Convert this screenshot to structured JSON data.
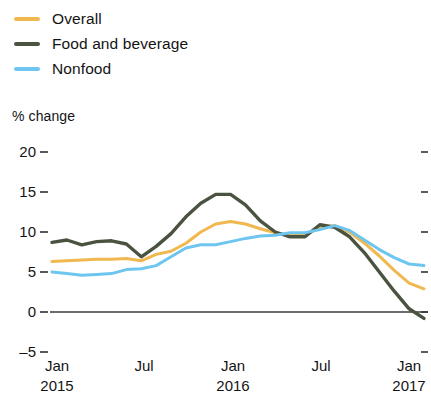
{
  "chart_data": {
    "type": "line",
    "title": "",
    "xlabel": "",
    "ylabel": "% change",
    "ylim": [
      -5,
      20
    ],
    "yticks": [
      20,
      15,
      10,
      5,
      0,
      -5
    ],
    "ytick_labels": [
      "20",
      "15",
      "10",
      "5",
      "0",
      "–5"
    ],
    "grid": false,
    "legend_position": "top-left",
    "zero_line": true,
    "x_tick_labels": [
      {
        "month": "Jan",
        "year": "2015"
      },
      {
        "month": "Jul",
        "year": ""
      },
      {
        "month": "Jan",
        "year": "2016"
      },
      {
        "month": "Jul",
        "year": ""
      },
      {
        "month": "Jan",
        "year": "2017"
      }
    ],
    "x": [
      "2015-01",
      "2015-02",
      "2015-03",
      "2015-04",
      "2015-05",
      "2015-06",
      "2015-07",
      "2015-08",
      "2015-09",
      "2015-10",
      "2015-11",
      "2015-12",
      "2016-01",
      "2016-02",
      "2016-03",
      "2016-04",
      "2016-05",
      "2016-06",
      "2016-07",
      "2016-08",
      "2016-09",
      "2016-10",
      "2016-11",
      "2016-12",
      "2017-01",
      "2017-02"
    ],
    "series": [
      {
        "name": "Overall",
        "color": "#F0B84E",
        "values": [
          6.3,
          6.4,
          6.5,
          6.6,
          6.6,
          6.7,
          6.4,
          7.2,
          7.6,
          8.6,
          10.0,
          11.0,
          11.3,
          11.0,
          10.4,
          9.9,
          9.6,
          9.6,
          10.6,
          10.8,
          10.0,
          8.6,
          7.0,
          5.2,
          3.6,
          2.9
        ]
      },
      {
        "name": "Food and beverage",
        "color": "#4A5240",
        "values": [
          8.7,
          9.0,
          8.4,
          8.8,
          8.9,
          8.5,
          6.9,
          8.2,
          9.8,
          11.9,
          13.6,
          14.7,
          14.7,
          13.4,
          11.4,
          10.0,
          9.4,
          9.4,
          10.9,
          10.6,
          9.4,
          7.4,
          5.0,
          2.6,
          0.4,
          -0.8
        ]
      },
      {
        "name": "Nonfood",
        "color": "#6EC6F0",
        "values": [
          5.0,
          4.8,
          4.6,
          4.7,
          4.8,
          5.3,
          5.4,
          5.8,
          6.9,
          8.0,
          8.4,
          8.4,
          8.8,
          9.2,
          9.5,
          9.6,
          9.9,
          9.9,
          10.3,
          10.8,
          10.2,
          9.0,
          7.8,
          6.8,
          6.0,
          5.8
        ]
      }
    ]
  },
  "legend": {
    "items": [
      {
        "label": "Overall",
        "color": "#F0B84E"
      },
      {
        "label": "Food and beverage",
        "color": "#4A5240"
      },
      {
        "label": "Nonfood",
        "color": "#6EC6F0"
      }
    ]
  },
  "axis": {
    "y_title": "% change"
  }
}
